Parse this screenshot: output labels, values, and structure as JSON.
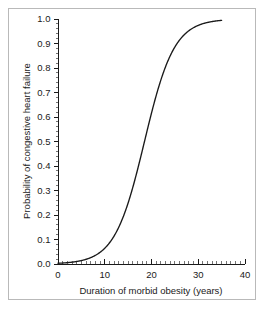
{
  "chart_data": {
    "type": "line",
    "title": "",
    "xlabel": "Duration of morbid obesity (years)",
    "ylabel": "Probability of congestive heart failure",
    "xlim": [
      0,
      40
    ],
    "ylim": [
      0.0,
      1.0
    ],
    "grid": false,
    "legend": "none",
    "x_ticks": [
      0,
      10,
      20,
      30,
      40
    ],
    "x_tick_labels": [
      "0",
      "10",
      "20",
      "30",
      "40"
    ],
    "x_minor_tick_step": 1,
    "y_ticks": [
      0.0,
      0.1,
      0.2,
      0.3,
      0.4,
      0.5,
      0.6,
      0.7,
      0.8,
      0.9,
      1.0
    ],
    "y_tick_labels": [
      "0.0",
      "0.1",
      "0.2",
      "0.3",
      "0.4",
      "0.5",
      "0.6",
      "0.7",
      "0.8",
      "0.9",
      "1.0"
    ],
    "y_minor_tick_step": 0.02,
    "series": [
      {
        "name": "Probability of congestive heart failure",
        "color": "#1a1a1a",
        "model": "logistic",
        "midpoint_x": 18.5,
        "slope": 0.315,
        "x_range": [
          0,
          35
        ],
        "x": [
          0,
          1,
          2,
          3,
          4,
          5,
          6,
          7,
          8,
          9,
          10,
          11,
          12,
          13,
          14,
          15,
          16,
          17,
          18,
          19,
          20,
          21,
          22,
          23,
          24,
          25,
          26,
          27,
          28,
          29,
          30,
          31,
          32,
          33,
          34,
          35
        ],
        "y": [
          0.003,
          0.004,
          0.006,
          0.008,
          0.011,
          0.015,
          0.02,
          0.027,
          0.037,
          0.05,
          0.067,
          0.089,
          0.118,
          0.155,
          0.2,
          0.255,
          0.319,
          0.391,
          0.468,
          0.546,
          0.622,
          0.692,
          0.754,
          0.806,
          0.848,
          0.882,
          0.909,
          0.93,
          0.947,
          0.959,
          0.969,
          0.977,
          0.982,
          0.987,
          0.99,
          0.992
        ]
      }
    ]
  },
  "axes": {
    "x_title": "Duration of morbid obesity (years)",
    "y_title": "Probability of congestive heart failure"
  }
}
